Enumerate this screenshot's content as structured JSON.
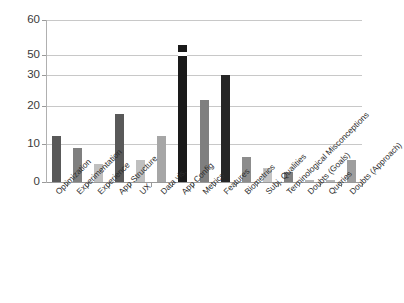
{
  "chart_data": {
    "type": "bar",
    "title": "",
    "subtitle": "",
    "xlabel": "",
    "ylabel": "",
    "legend": [],
    "legend_position": "none",
    "grid": true,
    "axis_break": {
      "present": true,
      "between": [
        30,
        50
      ],
      "note": "y-axis is broken: ticks jump from 30 directly to 50; the App Config bar is drawn with a white break notch"
    },
    "yticks": [
      0,
      10,
      20,
      30,
      50,
      60
    ],
    "ylim": [
      0,
      60
    ],
    "categories": [
      "Optimization",
      "Experimentation",
      "Experience",
      "App Structure",
      "UX",
      "Data vis.",
      "App Config",
      "Metrics",
      "Features",
      "Biometrics",
      "Subj. Qualities",
      "Terminological Misconceptions",
      "Doubts (Goals)",
      "Queries",
      "Doubts (Approach)"
    ],
    "values": [
      12,
      9,
      4.8,
      18,
      5.8,
      12,
      53,
      21.8,
      30,
      6.7,
      3.8,
      2.7,
      0.6,
      0.6,
      5.7
    ],
    "bar_colors": [
      "#595959",
      "#7f7f7f",
      "#bfbfbf",
      "#595959",
      "#bfbfbf",
      "#a6a6a6",
      "#1a1a1a",
      "#7f7f7f",
      "#262626",
      "#8c8c8c",
      "#c4c4c4",
      "#808080",
      "#b5b5b5",
      "#b5b5b5",
      "#9e9e9e"
    ]
  },
  "axis": {
    "tick_labels": [
      "60",
      "50",
      "30",
      "20",
      "10",
      "0"
    ]
  }
}
